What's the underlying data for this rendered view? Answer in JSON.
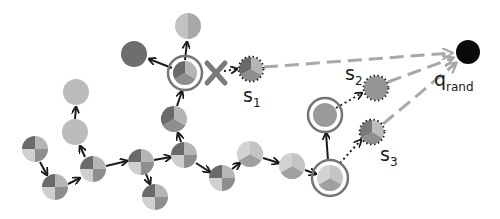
{
  "figure": {
    "colors": {
      "dark": "#6b6b6b",
      "mid": "#8f8f8f",
      "light": "#bdbdbd",
      "lighter": "#d0d0d0",
      "ring": "#707070",
      "x_mark": "#7a7a7a",
      "dashed": "#a8a8a8",
      "q_rand": "#0a0a0a",
      "edge": "#1a1a1a"
    },
    "labels": {
      "s1": {
        "base": "s",
        "sub": "1"
      },
      "s2": {
        "base": "s",
        "sub": "2"
      },
      "s3": {
        "base": "s",
        "sub": "3"
      },
      "q_rand": {
        "base": "q",
        "sub": "rand"
      }
    },
    "nodes": [
      {
        "id": "n_top",
        "x": 188,
        "y": 26,
        "type": "halves"
      },
      {
        "id": "n_dark",
        "x": 134,
        "y": 54,
        "type": "solid_dark"
      },
      {
        "id": "n_hub",
        "x": 185,
        "y": 73,
        "type": "thirds",
        "ring": true
      },
      {
        "id": "s1",
        "x": 251,
        "y": 69,
        "type": "thirds",
        "dotted": true
      },
      {
        "id": "n_left_top",
        "x": 76,
        "y": 92,
        "type": "solid_light"
      },
      {
        "id": "n_left_mid",
        "x": 75,
        "y": 132,
        "type": "solid_light"
      },
      {
        "id": "n_start",
        "x": 35,
        "y": 149,
        "type": "quad"
      },
      {
        "id": "n_a",
        "x": 55,
        "y": 187,
        "type": "quad"
      },
      {
        "id": "n_b",
        "x": 93,
        "y": 169,
        "type": "quad"
      },
      {
        "id": "n_c",
        "x": 141,
        "y": 162,
        "type": "quad"
      },
      {
        "id": "n_c_down",
        "x": 155,
        "y": 197,
        "type": "quad"
      },
      {
        "id": "n_d",
        "x": 184,
        "y": 155,
        "type": "quad"
      },
      {
        "id": "n_e",
        "x": 174,
        "y": 119,
        "type": "thirds"
      },
      {
        "id": "n_f",
        "x": 222,
        "y": 178,
        "type": "quad"
      },
      {
        "id": "n_g",
        "x": 250,
        "y": 154,
        "type": "thirds_light"
      },
      {
        "id": "n_h",
        "x": 292,
        "y": 166,
        "type": "thirds_light"
      },
      {
        "id": "n_i",
        "x": 330,
        "y": 178,
        "type": "thirds_light",
        "ring": true
      },
      {
        "id": "n_j",
        "x": 325,
        "y": 115,
        "type": "solid_mid",
        "ring": true
      },
      {
        "id": "s2",
        "x": 376,
        "y": 88,
        "type": "solid_mid",
        "dotted": true
      },
      {
        "id": "s3",
        "x": 372,
        "y": 132,
        "type": "thirds",
        "dotted": true
      },
      {
        "id": "q_rand",
        "x": 468,
        "y": 52,
        "type": "solid_black"
      }
    ]
  }
}
